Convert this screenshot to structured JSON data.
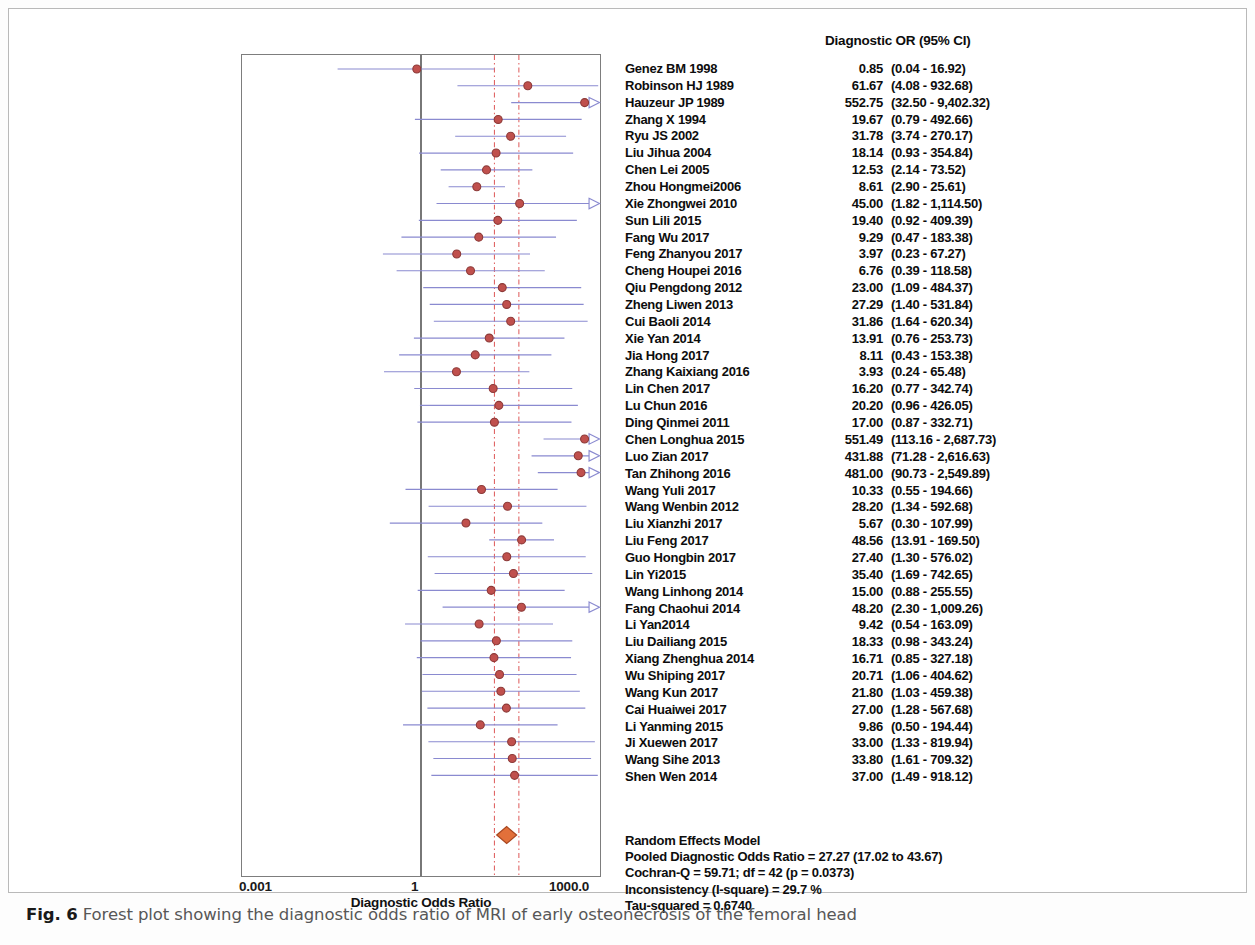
{
  "figure": {
    "caption_label": "Fig. 6",
    "caption_text": " Forest plot showing the diagnostic odds ratio of MRI of early osteonecrosis of the femoral head"
  },
  "axis": {
    "title": "Diagnostic Odds Ratio",
    "tick_left": "0.001",
    "tick_mid": "1",
    "tick_right": "1000.0"
  },
  "table": {
    "header": "Diagnostic OR (95% CI)"
  },
  "summary": {
    "model": "Random Effects Model",
    "pooled": "Pooled Diagnostic Odds Ratio = 27.27 (17.02 to 43.67)",
    "cochran": "Cochran-Q = 59.71; df =  42 (p = 0.0373)",
    "inconsistency": "Inconsistency (I-square) = 29.7 %",
    "tau": "Tau-squared = 0.6740"
  },
  "colors": {
    "marker_fill": "#c0504d",
    "marker_stroke": "#8c3a38",
    "ci_line": "#8a8ad0",
    "reference_line": "#555555",
    "dashed_line": "#e06666",
    "diamond_fill": "#e2703a",
    "diamond_stroke": "#a8461f",
    "plot_border": "#7d7d7d"
  },
  "chart_data": {
    "type": "forest",
    "title": "Forest plot showing the diagnostic odds ratio of MRI of early osteonecrosis of the femoral head",
    "xlabel": "Diagnostic Odds Ratio",
    "xscale": "log",
    "xlim": [
      0.001,
      1000.0
    ],
    "xticks": [
      0.001,
      1,
      1000.0
    ],
    "xticklabels": [
      "0.001",
      "1",
      "1000.0"
    ],
    "reference_line": 1,
    "pooled_ci_dashed_lines": [
      17.02,
      43.67
    ],
    "effect_measure": "Diagnostic OR (95% CI)",
    "studies": [
      {
        "name": "Genez BM 1998",
        "or": 0.85,
        "or_label": "0.85",
        "ci_label": "(0.04 - 16.92)",
        "low": 0.04,
        "high": 16.92
      },
      {
        "name": "Robinson HJ 1989",
        "or": 61.67,
        "or_label": "61.67",
        "ci_label": "(4.08 - 932.68)",
        "low": 4.08,
        "high": 932.68
      },
      {
        "name": "Hauzeur JP 1989",
        "or": 552.75,
        "or_label": "552.75",
        "ci_label": "(32.50 - 9,402.32)",
        "low": 32.5,
        "high": 9402.32
      },
      {
        "name": "Zhang X 1994",
        "or": 19.67,
        "or_label": "19.67",
        "ci_label": "(0.79 - 492.66)",
        "low": 0.79,
        "high": 492.66
      },
      {
        "name": "Ryu JS 2002",
        "or": 31.78,
        "or_label": "31.78",
        "ci_label": "(3.74 - 270.17)",
        "low": 3.74,
        "high": 270.17
      },
      {
        "name": "Liu Jihua 2004",
        "or": 18.14,
        "or_label": "18.14",
        "ci_label": "(0.93 - 354.84)",
        "low": 0.93,
        "high": 354.84
      },
      {
        "name": "Chen Lei 2005",
        "or": 12.53,
        "or_label": "12.53",
        "ci_label": "(2.14 - 73.52)",
        "low": 2.14,
        "high": 73.52
      },
      {
        "name": "Zhou Hongmei2006",
        "or": 8.61,
        "or_label": "8.61",
        "ci_label": "(2.90 - 25.61)",
        "low": 2.9,
        "high": 25.61
      },
      {
        "name": "Xie Zhongwei 2010",
        "or": 45.0,
        "or_label": "45.00",
        "ci_label": "(1.82 - 1,114.50)",
        "low": 1.82,
        "high": 1114.5
      },
      {
        "name": "Sun Lili 2015",
        "or": 19.4,
        "or_label": "19.40",
        "ci_label": "(0.92 - 409.39)",
        "low": 0.92,
        "high": 409.39
      },
      {
        "name": "Fang Wu 2017",
        "or": 9.29,
        "or_label": "9.29",
        "ci_label": "(0.47 - 183.38)",
        "low": 0.47,
        "high": 183.38
      },
      {
        "name": "Feng Zhanyou 2017",
        "or": 3.97,
        "or_label": "3.97",
        "ci_label": "(0.23 - 67.27)",
        "low": 0.23,
        "high": 67.27
      },
      {
        "name": "Cheng Houpei 2016",
        "or": 6.76,
        "or_label": "6.76",
        "ci_label": "(0.39 - 118.58)",
        "low": 0.39,
        "high": 118.58
      },
      {
        "name": "Qiu Pengdong 2012",
        "or": 23.0,
        "or_label": "23.00",
        "ci_label": "(1.09 - 484.37)",
        "low": 1.09,
        "high": 484.37
      },
      {
        "name": "Zheng Liwen 2013",
        "or": 27.29,
        "or_label": "27.29",
        "ci_label": "(1.40 - 531.84)",
        "low": 1.4,
        "high": 531.84
      },
      {
        "name": "Cui Baoli 2014",
        "or": 31.86,
        "or_label": "31.86",
        "ci_label": "(1.64 - 620.34)",
        "low": 1.64,
        "high": 620.34
      },
      {
        "name": "Xie Yan 2014",
        "or": 13.91,
        "or_label": "13.91",
        "ci_label": "(0.76 - 253.73)",
        "low": 0.76,
        "high": 253.73
      },
      {
        "name": "Jia Hong 2017",
        "or": 8.11,
        "or_label": "8.11",
        "ci_label": "(0.43 - 153.38)",
        "low": 0.43,
        "high": 153.38
      },
      {
        "name": "Zhang Kaixiang 2016",
        "or": 3.93,
        "or_label": "3.93",
        "ci_label": "(0.24 - 65.48)",
        "low": 0.24,
        "high": 65.48
      },
      {
        "name": "Lin Chen 2017",
        "or": 16.2,
        "or_label": "16.20",
        "ci_label": "(0.77 - 342.74)",
        "low": 0.77,
        "high": 342.74
      },
      {
        "name": "Lu Chun 2016",
        "or": 20.2,
        "or_label": "20.20",
        "ci_label": "(0.96 - 426.05)",
        "low": 0.96,
        "high": 426.05
      },
      {
        "name": "Ding Qinmei 2011",
        "or": 17.0,
        "or_label": "17.00",
        "ci_label": "(0.87 - 332.71)",
        "low": 0.87,
        "high": 332.71
      },
      {
        "name": "Chen Longhua 2015",
        "or": 551.49,
        "or_label": "551.49",
        "ci_label": "(113.16 - 2,687.73)",
        "low": 113.16,
        "high": 2687.73
      },
      {
        "name": "Luo Zian 2017",
        "or": 431.88,
        "or_label": "431.88",
        "ci_label": "(71.28 - 2,616.63)",
        "low": 71.28,
        "high": 2616.63
      },
      {
        "name": "Tan Zhihong 2016",
        "or": 481.0,
        "or_label": "481.00",
        "ci_label": "(90.73 - 2,549.89)",
        "low": 90.73,
        "high": 2549.89
      },
      {
        "name": "Wang Yuli 2017",
        "or": 10.33,
        "or_label": "10.33",
        "ci_label": "(0.55 - 194.66)",
        "low": 0.55,
        "high": 194.66
      },
      {
        "name": "Wang Wenbin 2012",
        "or": 28.2,
        "or_label": "28.20",
        "ci_label": "(1.34 - 592.68)",
        "low": 1.34,
        "high": 592.68
      },
      {
        "name": "Liu Xianzhi 2017",
        "or": 5.67,
        "or_label": "5.67",
        "ci_label": "(0.30 - 107.99)",
        "low": 0.3,
        "high": 107.99
      },
      {
        "name": "Liu Feng 2017",
        "or": 48.56,
        "or_label": "48.56",
        "ci_label": "(13.91 - 169.50)",
        "low": 13.91,
        "high": 169.5
      },
      {
        "name": "Guo Hongbin 2017",
        "or": 27.4,
        "or_label": "27.40",
        "ci_label": "(1.30 - 576.02)",
        "low": 1.3,
        "high": 576.02
      },
      {
        "name": "Lin Yi2015",
        "or": 35.4,
        "or_label": "35.40",
        "ci_label": "(1.69 - 742.65)",
        "low": 1.69,
        "high": 742.65
      },
      {
        "name": "Wang Linhong 2014",
        "or": 15.0,
        "or_label": "15.00",
        "ci_label": "(0.88 - 255.55)",
        "low": 0.88,
        "high": 255.55
      },
      {
        "name": "Fang Chaohui 2014",
        "or": 48.2,
        "or_label": "48.20",
        "ci_label": "(2.30 - 1,009.26)",
        "low": 2.3,
        "high": 1009.26
      },
      {
        "name": "Li Yan2014",
        "or": 9.42,
        "or_label": "9.42",
        "ci_label": "(0.54 - 163.09)",
        "low": 0.54,
        "high": 163.09
      },
      {
        "name": "Liu Dailiang 2015",
        "or": 18.33,
        "or_label": "18.33",
        "ci_label": "(0.98 - 343.24)",
        "low": 0.98,
        "high": 343.24
      },
      {
        "name": "Xiang Zhenghua 2014",
        "or": 16.71,
        "or_label": "16.71",
        "ci_label": "(0.85 - 327.18)",
        "low": 0.85,
        "high": 327.18
      },
      {
        "name": "Wu Shiping 2017",
        "or": 20.71,
        "or_label": "20.71",
        "ci_label": "(1.06 - 404.62)",
        "low": 1.06,
        "high": 404.62
      },
      {
        "name": "Wang Kun 2017",
        "or": 21.8,
        "or_label": "21.80",
        "ci_label": "(1.03 - 459.38)",
        "low": 1.03,
        "high": 459.38
      },
      {
        "name": "Cai Huaiwei 2017",
        "or": 27.0,
        "or_label": "27.00",
        "ci_label": "(1.28 - 567.68)",
        "low": 1.28,
        "high": 567.68
      },
      {
        "name": "Li Yanming 2015",
        "or": 9.86,
        "or_label": "9.86",
        "ci_label": "(0.50 - 194.44)",
        "low": 0.5,
        "high": 194.44
      },
      {
        "name": "Ji Xuewen 2017",
        "or": 33.0,
        "or_label": "33.00",
        "ci_label": "(1.33 - 819.94)",
        "low": 1.33,
        "high": 819.94
      },
      {
        "name": "Wang Sihe 2013",
        "or": 33.8,
        "or_label": "33.80",
        "ci_label": "(1.61 - 709.32)",
        "low": 1.61,
        "high": 709.32
      },
      {
        "name": "Shen Wen 2014",
        "or": 37.0,
        "or_label": "37.00",
        "ci_label": "(1.49 - 918.12)",
        "low": 1.49,
        "high": 918.12
      }
    ],
    "pooled": {
      "name": "Random Effects Model",
      "or": 27.27,
      "low": 17.02,
      "high": 43.67,
      "cochran_q": 59.71,
      "df": 42,
      "p": 0.0373,
      "i_square_pct": 29.7,
      "tau_squared": 0.674
    }
  }
}
